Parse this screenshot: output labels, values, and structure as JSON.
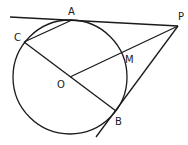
{
  "diagram": {
    "type": "geometry",
    "circle": {
      "center_label": "O",
      "cx": 70,
      "cy": 77,
      "r": 57
    },
    "points": [
      {
        "label": "A",
        "x": 72,
        "y": 20,
        "lx": 68,
        "ly": 15
      },
      {
        "label": "P",
        "x": 178,
        "y": 26,
        "lx": 178,
        "ly": 20
      },
      {
        "label": "C",
        "x": 24,
        "y": 42,
        "lx": 14,
        "ly": 41
      },
      {
        "label": "O",
        "x": 70,
        "y": 77,
        "lx": 57,
        "ly": 88
      },
      {
        "label": "M",
        "x": 122,
        "y": 56,
        "lx": 125,
        "ly": 63
      },
      {
        "label": "B",
        "x": 116,
        "y": 111,
        "lx": 115,
        "ly": 125
      }
    ],
    "segments": [
      {
        "name": "tangent-PA",
        "x1": 10,
        "y1": 17,
        "x2": 178,
        "y2": 26
      },
      {
        "name": "chord-CA",
        "x1": 24,
        "y1": 42,
        "x2": 72,
        "y2": 20
      },
      {
        "name": "diameter-CB",
        "x1": 24,
        "y1": 42,
        "x2": 116,
        "y2": 111
      },
      {
        "name": "segment-OP",
        "x1": 70,
        "y1": 77,
        "x2": 178,
        "y2": 26
      },
      {
        "name": "tangent-PB",
        "x1": 178,
        "y1": 26,
        "x2": 96,
        "y2": 137
      }
    ]
  }
}
